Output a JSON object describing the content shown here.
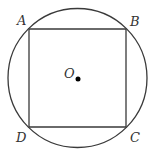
{
  "diagram": {
    "canvas": {
      "width": 154,
      "height": 151
    },
    "colors": {
      "stroke": "#3a3a3a",
      "label": "#333333",
      "center_dot": "#000000",
      "background": "#ffffff"
    },
    "circle": {
      "cx": 77.5,
      "cy": 78,
      "r": 69.5
    },
    "square": {
      "vertices": {
        "A": {
          "x": 29,
          "y": 29
        },
        "B": {
          "x": 126,
          "y": 29
        },
        "C": {
          "x": 126,
          "y": 127
        },
        "D": {
          "x": 29,
          "y": 127
        }
      }
    },
    "center": {
      "x": 78,
      "y": 79,
      "dot_r": 2.5
    },
    "labels": {
      "A": {
        "text": "A",
        "x": 17,
        "y": 25
      },
      "B": {
        "text": "B",
        "x": 130,
        "y": 26
      },
      "C": {
        "text": "C",
        "x": 130,
        "y": 142
      },
      "D": {
        "text": "D",
        "x": 16,
        "y": 142
      },
      "O": {
        "text": "O",
        "x": 64,
        "y": 78
      }
    }
  }
}
